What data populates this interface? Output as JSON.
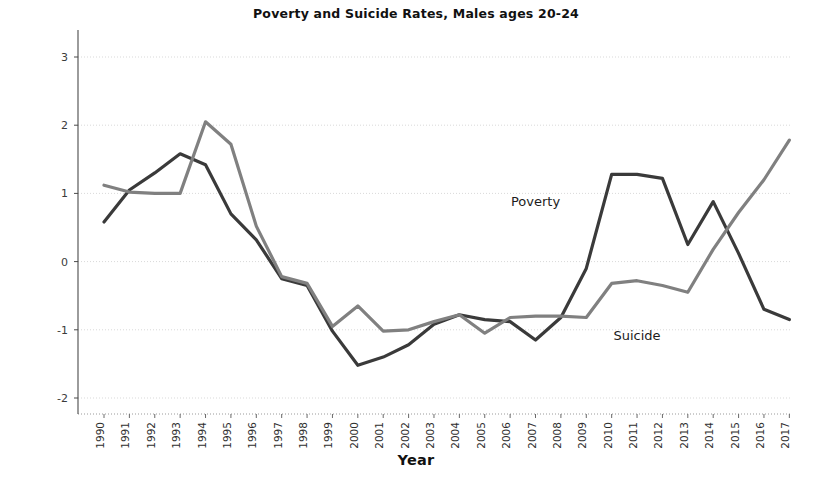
{
  "chart_data": {
    "type": "line",
    "title": "Poverty and Suicide Rates, Males ages 20-24",
    "xlabel": "Year",
    "ylabel": "Standardized Rates",
    "xlim": [
      1990,
      2017
    ],
    "ylim": [
      -2,
      3
    ],
    "yticks": [
      3,
      2,
      1,
      0,
      -1,
      -2
    ],
    "grid": true,
    "legend": "inline-annotations",
    "categories": [
      "1990",
      "1991",
      "1992",
      "1993",
      "1994",
      "1995",
      "1996",
      "1997",
      "1998",
      "1999",
      "2000",
      "2001",
      "2002",
      "2003",
      "2004",
      "2005",
      "2006",
      "2007",
      "2008",
      "2009",
      "2010",
      "2011",
      "2012",
      "2013",
      "2014",
      "2015",
      "2016",
      "2017"
    ],
    "series": [
      {
        "name": "Poverty",
        "color": "#3a3a3a",
        "label_x": 2007,
        "label_y": 0.82,
        "values": [
          0.58,
          1.05,
          1.3,
          1.58,
          1.42,
          0.7,
          0.32,
          -0.25,
          -0.35,
          -1.02,
          -1.52,
          -1.4,
          -1.22,
          -0.92,
          -0.78,
          -0.85,
          -0.88,
          -1.15,
          -0.82,
          -0.1,
          1.28,
          1.28,
          1.22,
          0.25,
          0.88,
          0.12,
          -0.7,
          -0.85
        ]
      },
      {
        "name": "Suicide",
        "color": "#808080",
        "label_x": 2011,
        "label_y": -1.15,
        "values": [
          1.12,
          1.02,
          1.0,
          1.0,
          2.05,
          1.72,
          0.52,
          -0.22,
          -0.32,
          -0.95,
          -0.65,
          -1.02,
          -1.0,
          -0.88,
          -0.78,
          -1.05,
          -0.82,
          -0.8,
          -0.8,
          -0.82,
          -0.32,
          -0.28,
          -0.35,
          -0.45,
          0.18,
          0.72,
          1.2,
          1.78
        ]
      }
    ]
  }
}
